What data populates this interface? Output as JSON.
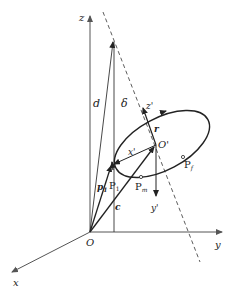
{
  "figure": {
    "type": "3d-geometry-diagram",
    "background": "#ffffff",
    "ink_color": "#222222",
    "axis_color": "#555555"
  },
  "axes": {
    "x": {
      "label": "x"
    },
    "y": {
      "label": "y"
    },
    "z": {
      "label": "z"
    },
    "origin": {
      "label": "O"
    }
  },
  "local_frame": {
    "origin": {
      "label": "O'"
    },
    "x_axis": {
      "label": "x'"
    },
    "y_axis": {
      "label": "y'"
    },
    "z_axis": {
      "label": "z'"
    }
  },
  "vectors": {
    "d": {
      "label": "d"
    },
    "c": {
      "label": "c"
    },
    "p1": {
      "label": "p",
      "subscript": "1"
    },
    "r": {
      "label": "r"
    }
  },
  "angles": {
    "delta": {
      "label": "δ"
    }
  },
  "points": {
    "P1": {
      "label": "P",
      "subscript": "1"
    },
    "Pm": {
      "label": "P",
      "subscript": "m"
    },
    "Pf": {
      "label": "P",
      "subscript": "f"
    }
  }
}
